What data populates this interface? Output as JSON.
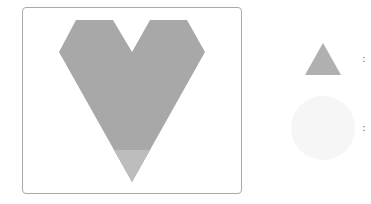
{
  "puzzle": {
    "main_shape": {
      "name": "heart",
      "fill": "#a8a8a8",
      "highlight_piece": {
        "name": "bottom-triangle",
        "fill": "#bdbdbd"
      }
    },
    "legend": [
      {
        "shape": "triangle",
        "fill": "#b0b0b0",
        "separator": ":"
      },
      {
        "shape": "circle",
        "fill": "#f6f6f6",
        "separator": ":"
      }
    ]
  }
}
